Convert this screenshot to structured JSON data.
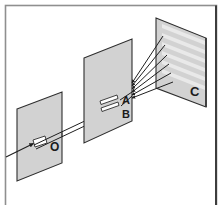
{
  "figure": {
    "type": "optics-ray-diagram",
    "background_color": "#ffffff",
    "border": {
      "color": "#8c8c8c",
      "right_edge_color": "#3d3d3d",
      "width_px": 2
    },
    "planes": [
      {
        "id": "plane-o",
        "label": "O",
        "label_role": "single-slit-source-screen",
        "fill": "#d2d2d2",
        "edge_color": "#2e2e2e",
        "slit_count": 1
      },
      {
        "id": "plane-ab",
        "label": "",
        "label_role": "double-slit-screen",
        "fill": "#d2d2d2",
        "edge_color": "#2e2e2e",
        "slit_count": 2
      },
      {
        "id": "plane-c",
        "label": "C",
        "label_role": "observation-screen",
        "fill": "#d2d2d2",
        "edge_color": "#2e2e2e",
        "slit_count": 0
      }
    ],
    "slit_labels": {
      "upper": "A",
      "lower": "B",
      "source": "O",
      "screen": "C"
    },
    "rays": {
      "incoming_count": 1,
      "beam_segments": 2,
      "diffracted_fan_count": 6,
      "color": "#222222",
      "arrowheads": true
    },
    "fringes": {
      "count": 6,
      "color": "#e9e9e9",
      "description": "interference bands on screen C"
    }
  }
}
